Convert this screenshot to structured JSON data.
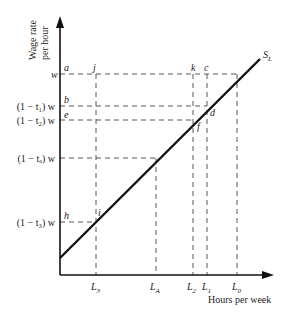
{
  "axes": {
    "y_label_line1": "Wage rate",
    "y_label_line2": "per hour",
    "x_label": "Hours per week"
  },
  "curve_label": "S",
  "curve_label_sub": "L",
  "y_ticks": [
    {
      "text": "w",
      "y": 74
    },
    {
      "text": "(1 − t₁) w",
      "y": 106
    },
    {
      "text": "(1 − t₂) w",
      "y": 120
    },
    {
      "text": "(1 − tₐ) w",
      "y": 158
    },
    {
      "text": "(1 − t₃) w",
      "y": 222
    }
  ],
  "x_ticks": [
    {
      "text": "L",
      "sub": "3",
      "x": 96
    },
    {
      "text": "L",
      "sub": "A",
      "x": 156
    },
    {
      "text": "L",
      "sub": "2",
      "x": 193
    },
    {
      "text": "L",
      "sub": "1",
      "x": 207
    },
    {
      "text": "L",
      "sub": "0",
      "x": 237
    }
  ],
  "points": {
    "a": "a",
    "b": "b",
    "c": "c",
    "d": "d",
    "e": "e",
    "f": "f",
    "h": "h",
    "i": "i",
    "j": "j",
    "k": "k"
  },
  "colors": {
    "line": "#111111",
    "dash": "#444444"
  }
}
